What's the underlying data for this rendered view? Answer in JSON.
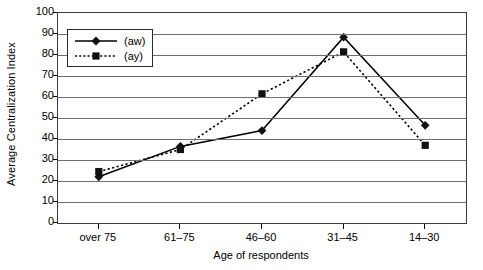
{
  "chart_data": {
    "type": "line",
    "title": "",
    "xlabel": "Age of respondents",
    "ylabel": "Average Centralization Index",
    "categories": [
      "over 75",
      "61–75",
      "46–60",
      "31–45",
      "14–30"
    ],
    "series": [
      {
        "name": "(aw)",
        "values": [
          22,
          36.5,
          44,
          88.5,
          46.5
        ],
        "marker": "diamond",
        "linestyle": "solid",
        "color": "#000000"
      },
      {
        "name": "(ay)",
        "values": [
          24.5,
          35,
          61.5,
          81.5,
          37
        ],
        "marker": "square",
        "linestyle": "dotted",
        "color": "#000000"
      }
    ],
    "ylim": [
      0,
      100
    ],
    "ytick_values": [
      0,
      10,
      20,
      30,
      40,
      50,
      60,
      70,
      80,
      90,
      100
    ],
    "ytick_labels": [
      "0",
      "10",
      "20",
      "30",
      "40",
      "50",
      "60",
      "70",
      "80",
      "90",
      "100"
    ],
    "grid": "horizontal",
    "legend_position": "upper left",
    "legend_entries": [
      "(aw)",
      "(ay)"
    ]
  }
}
